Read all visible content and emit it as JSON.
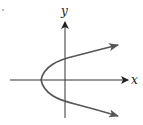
{
  "figure": {
    "type": "sideways-parabola",
    "axes": {
      "x_label": "x",
      "y_label": "y"
    },
    "colors": {
      "axis": "#333333",
      "curve": "#555555",
      "background": "#ffffff"
    }
  }
}
